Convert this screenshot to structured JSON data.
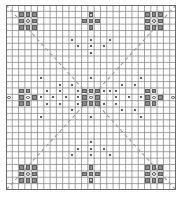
{
  "figure": {
    "title": "",
    "type": "lattice-symmetry-diagram",
    "background_color": "#ffffff",
    "grid": {
      "columns": 27,
      "rows": 29,
      "cell_px": 6.3,
      "line_color": "#8a8a8a",
      "border_color": "#6a6a6a",
      "origin_x_px": 6,
      "origin_y_px": 5,
      "width_px": 170,
      "height_px": 185
    },
    "colors": {
      "square_fill": "#8d8d8d",
      "square_stroke": "#5e5e5e",
      "circle_fill": "#ffffff",
      "circle_stroke": "#4a4a4a",
      "dot_fill": "#2b2b2b",
      "mirror_line": "#9a9a9a"
    },
    "legend_note": "",
    "squares": [
      [
        2,
        1
      ],
      [
        3,
        1
      ],
      [
        4,
        1
      ],
      [
        2,
        2
      ],
      [
        4,
        2
      ],
      [
        2,
        3
      ],
      [
        3,
        3
      ],
      [
        4,
        3
      ],
      [
        13,
        1
      ],
      [
        12,
        2
      ],
      [
        13,
        2
      ],
      [
        14,
        2
      ],
      [
        13,
        3
      ],
      [
        22,
        1
      ],
      [
        23,
        1
      ],
      [
        24,
        1
      ],
      [
        22,
        2
      ],
      [
        24,
        2
      ],
      [
        22,
        3
      ],
      [
        23,
        3
      ],
      [
        24,
        3
      ],
      [
        2,
        13
      ],
      [
        3,
        13
      ],
      [
        2,
        14
      ],
      [
        4,
        14
      ],
      [
        2,
        15
      ],
      [
        3,
        15
      ],
      [
        12,
        13
      ],
      [
        13,
        13
      ],
      [
        14,
        13
      ],
      [
        12,
        14
      ],
      [
        14,
        14
      ],
      [
        12,
        15
      ],
      [
        13,
        15
      ],
      [
        14,
        15
      ],
      [
        22,
        13
      ],
      [
        23,
        13
      ],
      [
        22,
        14
      ],
      [
        24,
        14
      ],
      [
        22,
        15
      ],
      [
        23,
        15
      ],
      [
        13,
        25
      ],
      [
        12,
        26
      ],
      [
        13,
        26
      ],
      [
        14,
        26
      ],
      [
        13,
        27
      ],
      [
        2,
        25
      ],
      [
        3,
        25
      ],
      [
        4,
        25
      ],
      [
        2,
        26
      ],
      [
        4,
        26
      ],
      [
        2,
        27
      ],
      [
        3,
        27
      ],
      [
        4,
        27
      ],
      [
        22,
        25
      ],
      [
        23,
        25
      ],
      [
        24,
        25
      ],
      [
        22,
        26
      ],
      [
        24,
        26
      ],
      [
        22,
        27
      ],
      [
        23,
        27
      ],
      [
        24,
        27
      ]
    ],
    "circles": [
      [
        3,
        2
      ],
      [
        13,
        1
      ],
      [
        23,
        2
      ],
      [
        0,
        14
      ],
      [
        3,
        14
      ],
      [
        13,
        14
      ],
      [
        23,
        14
      ],
      [
        26,
        14
      ],
      [
        3,
        26
      ],
      [
        13,
        27
      ],
      [
        23,
        26
      ]
    ],
    "dots": [
      [
        10,
        5
      ],
      [
        13,
        5
      ],
      [
        16,
        5
      ],
      [
        11,
        6
      ],
      [
        13,
        6
      ],
      [
        15,
        6
      ],
      [
        13,
        7
      ],
      [
        5,
        11
      ],
      [
        8,
        12
      ],
      [
        10,
        12
      ],
      [
        11,
        13
      ],
      [
        9,
        14
      ],
      [
        11,
        14
      ],
      [
        13,
        11
      ],
      [
        6,
        13
      ],
      [
        8,
        13
      ],
      [
        7,
        14
      ],
      [
        5,
        14
      ],
      [
        6,
        15
      ],
      [
        8,
        15
      ],
      [
        5,
        17
      ],
      [
        11,
        15
      ],
      [
        10,
        16
      ],
      [
        13,
        17
      ],
      [
        16,
        13
      ],
      [
        18,
        12
      ],
      [
        20,
        12
      ],
      [
        21,
        11
      ],
      [
        15,
        13
      ],
      [
        17,
        13
      ],
      [
        19,
        14
      ],
      [
        17,
        14
      ],
      [
        21,
        14
      ],
      [
        15,
        15
      ],
      [
        17,
        15
      ],
      [
        21,
        17
      ],
      [
        20,
        16
      ],
      [
        18,
        16
      ],
      [
        13,
        21
      ],
      [
        11,
        22
      ],
      [
        13,
        22
      ],
      [
        15,
        22
      ],
      [
        10,
        23
      ],
      [
        13,
        23
      ],
      [
        16,
        23
      ]
    ],
    "mirror_lines": [
      {
        "x1": 0,
        "y1": 0,
        "x2": 170,
        "y2": 185,
        "style": "dashed"
      },
      {
        "x1": 170,
        "y1": 0,
        "x2": 0,
        "y2": 185,
        "style": "dashed"
      }
    ]
  }
}
